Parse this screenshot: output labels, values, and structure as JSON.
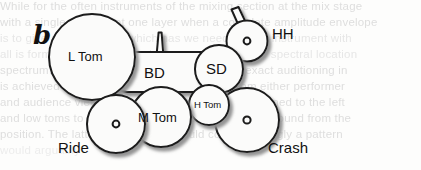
{
  "figure": {
    "panel_letter": "b",
    "caption_note": "drum kit layout diagram"
  },
  "background_text": {
    "note": "faint bleed-through text behind the figure",
    "lines": [
      "While for the often instruments of the mixing section at the mix stage",
      "with a single element at one layer when a complete amplitude envelope",
      "is to give a complicated which has we need a multi-instrument with",
      "all is formed by auto in a timbre spaced so that the spectral location",
      "spectrum. The first step of work analysis is an exact auditioning in",
      "is achieved way. There are no limits pattern from either performer",
      "and audience view. The former and high toms assigned to the left",
      "and low toms to the right and the second hears the sound from the",
      "position. The latter configuration would correspondingly a pattern",
      "would arguably"
    ]
  },
  "drum_kit": {
    "pieces": [
      {
        "id": "l-tom",
        "label": "L Tom",
        "type": "drum",
        "shape": "circle"
      },
      {
        "id": "bd",
        "label": "BD",
        "type": "drum",
        "shape": "rounded-rect"
      },
      {
        "id": "sd",
        "label": "SD",
        "type": "drum",
        "shape": "circle"
      },
      {
        "id": "hh",
        "label": "HH",
        "type": "cymbal",
        "shape": "circle-with-hole"
      },
      {
        "id": "h-tom",
        "label": "H Tom",
        "type": "drum",
        "shape": "circle"
      },
      {
        "id": "m-tom",
        "label": "M Tom",
        "type": "drum",
        "shape": "circle"
      },
      {
        "id": "ride",
        "label": "Ride",
        "type": "cymbal",
        "shape": "circle-with-hole"
      },
      {
        "id": "crash",
        "label": "Crash",
        "type": "cymbal",
        "shape": "circle-with-hole"
      }
    ],
    "labels": {
      "l_tom": "L Tom",
      "bd": "BD",
      "sd": "SD",
      "hh": "HH",
      "h_tom": "H Tom",
      "m_tom": "M Tom",
      "ride": "Ride",
      "crash": "Crash"
    }
  },
  "colors": {
    "stroke": "#1a1a1a",
    "fill": "#fbfbfa",
    "shadow": "#9a9a9a",
    "text": "#111111",
    "ghost_text": "#d9d9d9",
    "page_background": "#fdfdfc"
  }
}
